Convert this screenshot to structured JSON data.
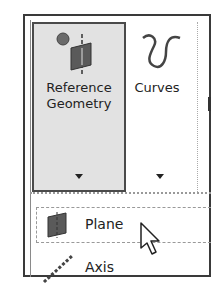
{
  "ribbon": {
    "buttons": [
      {
        "label_line1": "Reference",
        "label_line2": "Geometry",
        "icon": "reference-geometry-icon",
        "has_dropdown": true,
        "state": "pressed"
      },
      {
        "label_line1": "Curves",
        "icon": "curves-icon",
        "has_dropdown": true,
        "state": "normal"
      }
    ]
  },
  "dropdown": {
    "items": [
      {
        "label": "Plane",
        "icon": "plane-icon",
        "state": "hover"
      },
      {
        "label": "Axis",
        "icon": "axis-icon",
        "state": "normal"
      }
    ]
  },
  "cursor": {
    "type": "arrow-pointer"
  }
}
